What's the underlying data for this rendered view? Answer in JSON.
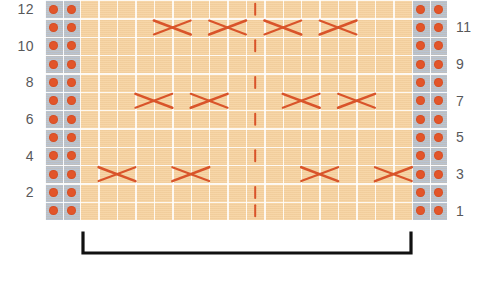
{
  "chart_data": {
    "type": "table",
    "grid": {
      "rows": 12,
      "columns": 22,
      "purl_columns_left": 2,
      "purl_columns_right": 2,
      "pattern_columns": 18,
      "cell_width": 18.42,
      "cell_height": 18.33
    },
    "row_numbers_left": [
      "12",
      "10",
      "8",
      "6",
      "4",
      "2"
    ],
    "row_numbers_right": [
      "11",
      "9",
      "7",
      "5",
      "3",
      "1"
    ],
    "row_number_left_values": [
      12,
      10,
      8,
      6,
      4,
      2
    ],
    "row_number_right_values": [
      11,
      9,
      7,
      5,
      3,
      1
    ],
    "colors": {
      "knit_background": "#f7d6a8",
      "purl_background": "#b9c4d2",
      "purl_dot": "#e2552a",
      "cable_stroke": "#d9542a",
      "gridline": "#ffffff",
      "row_number_text": "#58585a",
      "bracket": "#111111",
      "page_background": "#ffffff"
    },
    "symbols": {
      "purl": "purl-dot",
      "cable_cross": "cable-cross-x",
      "center_mark": "center-dashed-line"
    },
    "cable_rows": [
      {
        "row": 11,
        "label": "row-11-cables",
        "crosses": [
          {
            "start_col": 4,
            "span": 2,
            "direction": "right-over-left"
          },
          {
            "start_col": 7,
            "span": 2,
            "direction": "left-over-right"
          },
          {
            "start_col": 10,
            "span": 2,
            "direction": "right-over-left"
          },
          {
            "start_col": 13,
            "span": 2,
            "direction": "left-over-right"
          }
        ]
      },
      {
        "row": 7,
        "label": "row-7-cables",
        "crosses": [
          {
            "start_col": 3,
            "span": 2,
            "direction": "right-over-left"
          },
          {
            "start_col": 6,
            "span": 2,
            "direction": "left-over-right"
          },
          {
            "start_col": 11,
            "span": 2,
            "direction": "right-over-left"
          },
          {
            "start_col": 14,
            "span": 2,
            "direction": "left-over-right"
          }
        ]
      },
      {
        "row": 3,
        "label": "row-3-cables",
        "crosses": [
          {
            "start_col": 1,
            "span": 2,
            "direction": "right-over-left"
          },
          {
            "start_col": 5,
            "span": 2,
            "direction": "left-over-right"
          },
          {
            "start_col": 12,
            "span": 2,
            "direction": "right-over-left"
          },
          {
            "start_col": 16,
            "span": 2,
            "direction": "left-over-right"
          }
        ]
      }
    ],
    "center_marks": [
      {
        "row": 12,
        "col": 9,
        "label": "center-mark-row-12"
      },
      {
        "row": 10,
        "col": 9,
        "label": "center-mark-row-10"
      },
      {
        "row": 8,
        "col": 9,
        "label": "center-mark-row-8"
      },
      {
        "row": 6,
        "col": 9,
        "label": "center-mark-row-6"
      },
      {
        "row": 4,
        "col": 9,
        "label": "center-mark-row-4"
      },
      {
        "row": 2,
        "col": 9,
        "label": "center-mark-row-2"
      },
      {
        "row": 1,
        "col": 9,
        "label": "center-mark-row-1"
      }
    ],
    "repeat_bracket": {
      "label": "pattern-repeat-bracket",
      "start_x": 83,
      "end_x": 411,
      "text": ""
    },
    "xlabel": "",
    "ylabel": "",
    "legend": []
  }
}
